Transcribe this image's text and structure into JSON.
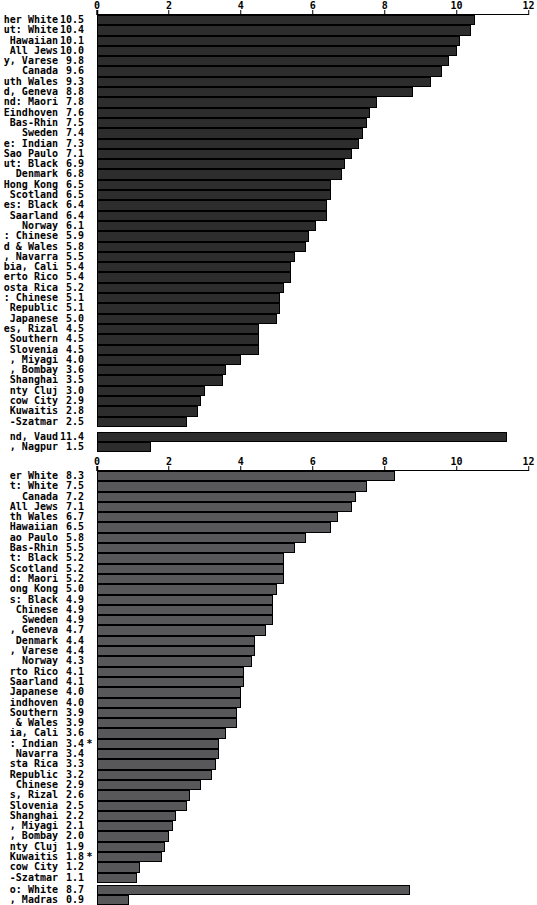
{
  "chart_data": [
    {
      "type": "bar",
      "orientation": "horizontal",
      "title": "",
      "xlabel": "",
      "ylabel": "",
      "xlim": [
        0,
        12
      ],
      "xticks": [
        0,
        2,
        4,
        6,
        8,
        10,
        12
      ],
      "grid": false,
      "legend": "none",
      "bar_color": "#2d2d2d",
      "note": "y-axis labels are clipped at the left edge of the screenshot; fragments shown as rendered",
      "categories": [
        "her White",
        "ut: White",
        "Hawaiian",
        "All Jews",
        "y, Varese",
        "Canada",
        "uth Wales",
        "d, Geneva",
        "nd: Maori",
        "Eindhoven",
        "Bas-Rhin",
        "Sweden",
        "e: Indian",
        "Sao Paulo",
        "ut: Black",
        "Denmark",
        "Hong Kong",
        "Scotland",
        "es: Black",
        "Saarland",
        "Norway",
        ": Chinese",
        "d & Wales",
        ", Navarra",
        "bia, Cali",
        "erto Rico",
        "osta Rica",
        ": Chinese",
        "Republic",
        "Japanese",
        "es, Rizal",
        "Southern",
        "Slovenia",
        ", Miyagi",
        ", Bombay",
        "Shanghai",
        "nty Cluj",
        "cow City",
        "Kuwaitis",
        "-Szatmar"
      ],
      "values": [
        10.5,
        10.4,
        10.1,
        10.0,
        9.8,
        9.6,
        9.3,
        8.8,
        7.8,
        7.6,
        7.5,
        7.4,
        7.3,
        7.1,
        6.9,
        6.8,
        6.5,
        6.5,
        6.4,
        6.4,
        6.1,
        5.9,
        5.8,
        5.5,
        5.4,
        5.4,
        5.2,
        5.1,
        5.1,
        5.0,
        4.5,
        4.5,
        4.5,
        4.0,
        3.6,
        3.5,
        3.0,
        2.9,
        2.8,
        2.5
      ],
      "flags": {},
      "separated": {
        "categories": [
          "nd, Vaud",
          ", Nagpur"
        ],
        "values": [
          11.4,
          1.5
        ],
        "flags": {}
      }
    },
    {
      "type": "bar",
      "orientation": "horizontal",
      "title": "",
      "xlabel": "",
      "ylabel": "",
      "xlim": [
        0,
        12
      ],
      "xticks": [
        0,
        2,
        4,
        6,
        8,
        10,
        12
      ],
      "grid": false,
      "legend": "none",
      "bar_color": "#58585a",
      "note": "y-axis labels are clipped at the left edge of the screenshot; fragments shown as rendered; * marks shown after flagged values",
      "categories": [
        "er White",
        "t: White",
        "Canada",
        "All Jews",
        "th Wales",
        "Hawaiian",
        "ao Paulo",
        "Bas-Rhin",
        "t: Black",
        "Scotland",
        "d: Maori",
        "ong Kong",
        "s: Black",
        "Chinese",
        "Sweden",
        ", Geneva",
        "Denmark",
        ", Varese",
        "Norway",
        "rto Rico",
        "Saarland",
        "Japanese",
        "indhoven",
        "Southern",
        "& Wales",
        "ia, Cali",
        ": Indian",
        "Navarra",
        "sta Rica",
        "Republic",
        "Chinese",
        "s, Rizal",
        "Slovenia",
        "Shanghai",
        ", Miyagi",
        ", Bombay",
        "nty Cluj",
        "Kuwaitis",
        "cow City",
        "-Szatmar"
      ],
      "values": [
        8.3,
        7.5,
        7.2,
        7.1,
        6.7,
        6.5,
        5.8,
        5.5,
        5.2,
        5.2,
        5.2,
        5.0,
        4.9,
        4.9,
        4.9,
        4.7,
        4.4,
        4.4,
        4.3,
        4.1,
        4.1,
        4.0,
        4.0,
        3.9,
        3.9,
        3.6,
        3.4,
        3.4,
        3.3,
        3.2,
        2.9,
        2.6,
        2.5,
        2.2,
        2.1,
        2.0,
        1.9,
        1.8,
        1.2,
        1.1
      ],
      "flags": {
        "26": "*",
        "37": "*"
      },
      "separated": {
        "categories": [
          "o: White",
          ", Madras"
        ],
        "values": [
          8.7,
          0.9
        ],
        "flags": {}
      }
    }
  ]
}
